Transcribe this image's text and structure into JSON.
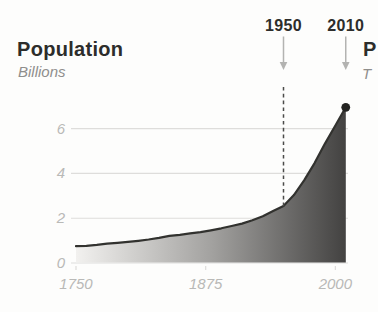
{
  "header": {
    "title": "Population",
    "subtitle": "Billions"
  },
  "annotations": [
    {
      "label": "1950",
      "year": 1950
    },
    {
      "label": "2010",
      "year": 2010
    }
  ],
  "next_panel": {
    "title_partial": "P",
    "subtitle_partial": "T"
  },
  "chart_data": {
    "type": "area",
    "title": "Population",
    "ylabel": "Billions",
    "x": [
      1750,
      1760,
      1770,
      1780,
      1790,
      1800,
      1810,
      1820,
      1830,
      1840,
      1850,
      1860,
      1870,
      1880,
      1890,
      1900,
      1910,
      1920,
      1930,
      1940,
      1950,
      1960,
      1970,
      1980,
      1990,
      2000,
      2010
    ],
    "values": [
      0.75,
      0.77,
      0.81,
      0.86,
      0.9,
      0.94,
      0.99,
      1.05,
      1.12,
      1.21,
      1.26,
      1.32,
      1.38,
      1.46,
      1.55,
      1.65,
      1.76,
      1.91,
      2.09,
      2.32,
      2.55,
      3.03,
      3.7,
      4.46,
      5.33,
      6.14,
      6.95
    ],
    "xlim": [
      1750,
      2010
    ],
    "ylim": [
      0,
      7.4
    ],
    "y_ticks": [
      0,
      2,
      4,
      6
    ],
    "x_ticks": [
      1750,
      1875,
      2000
    ],
    "grid": true,
    "legend": "none",
    "reference_line": {
      "year": 1950,
      "style": "dashed"
    },
    "marker": {
      "year": 2010,
      "value": 6.95
    },
    "colors": {
      "area_gradient_start": "#f2f1ef",
      "area_gradient_mid": "#a3a2a0",
      "area_gradient_end": "#434241",
      "line": "#32322f",
      "dot": "#232321",
      "gridline": "#dedddb",
      "tick_label": "#b9b9b7",
      "dashed_line": "#4b4b49",
      "arrow": "#b3b3b1",
      "title_text": "#2d2d2b",
      "subtitle_text": "#8f8e8c"
    }
  }
}
